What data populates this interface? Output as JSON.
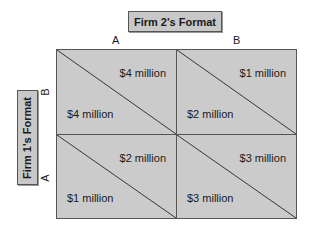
{
  "firm2": {
    "label": "Firm 2's Format",
    "columns": [
      "A",
      "B"
    ]
  },
  "firm1": {
    "label": "Firm 1's Format",
    "rows": [
      "B",
      "A"
    ]
  },
  "cells": [
    {
      "row": "B",
      "col": "A",
      "firm1_payoff": "$4 million",
      "firm2_payoff": "$4 million"
    },
    {
      "row": "B",
      "col": "B",
      "firm1_payoff": "$2 million",
      "firm2_payoff": "$1 million"
    },
    {
      "row": "A",
      "col": "A",
      "firm1_payoff": "$1 million",
      "firm2_payoff": "$2 million"
    },
    {
      "row": "A",
      "col": "B",
      "firm1_payoff": "$3 million",
      "firm2_payoff": "$3 million"
    }
  ],
  "colors": {
    "cell_fill": "#cbcbcb",
    "label_fill": "#c8c8c8",
    "border": "#555555"
  }
}
